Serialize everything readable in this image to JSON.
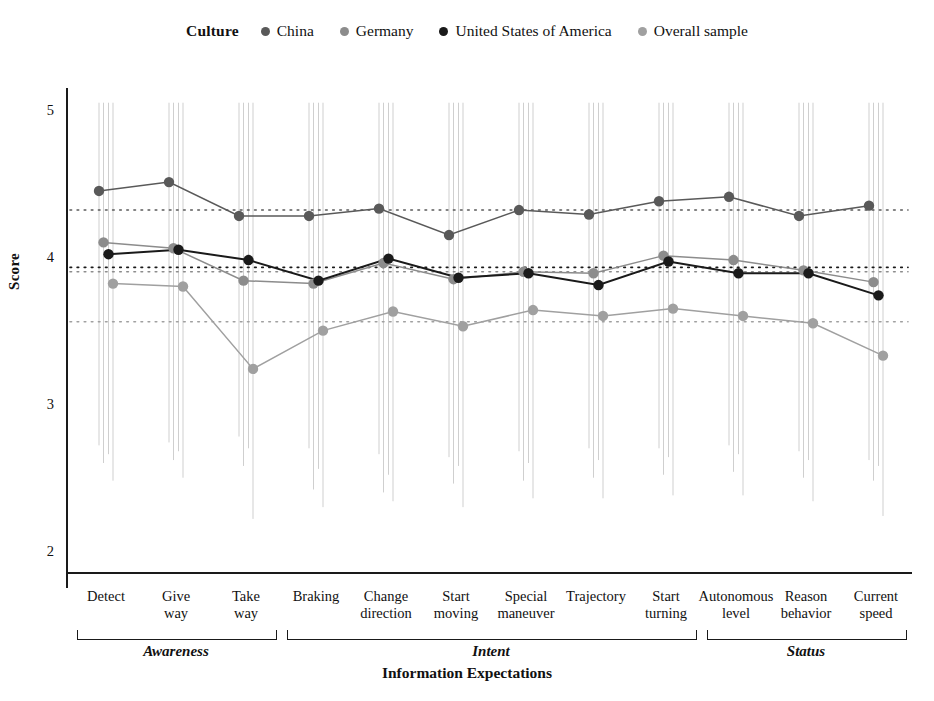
{
  "chart_data": {
    "type": "line",
    "title": "",
    "xlabel": "Information Expectations",
    "ylabel": "Score",
    "ylim": [
      1.75,
      5.15
    ],
    "yticks": [
      5,
      4,
      3,
      2
    ],
    "grid": false,
    "legend_title": "Culture",
    "legend_position": "top",
    "categories": [
      "Detect",
      "Give way",
      "Take way",
      "Braking",
      "Change direction",
      "Start moving",
      "Special maneuver",
      "Trajectory",
      "Start turning",
      "Autonomous level",
      "Reason behavior",
      "Current speed"
    ],
    "category_lines": [
      [
        "Detect"
      ],
      [
        "Give",
        "way"
      ],
      [
        "Take",
        "way"
      ],
      [
        "Braking"
      ],
      [
        "Change",
        "direction"
      ],
      [
        "Start",
        "moving"
      ],
      [
        "Special",
        "maneuver"
      ],
      [
        "Trajectory"
      ],
      [
        "Start",
        "turning"
      ],
      [
        "Autonomous",
        "level"
      ],
      [
        "Reason",
        "behavior"
      ],
      [
        "Current",
        "speed"
      ]
    ],
    "groups": [
      {
        "label": "Awareness",
        "start": 0,
        "end": 2
      },
      {
        "label": "Intent",
        "start": 3,
        "end": 8
      },
      {
        "label": "Status",
        "start": 9,
        "end": 11
      }
    ],
    "series": [
      {
        "name": "China",
        "color": "#595959",
        "values": [
          4.45,
          4.51,
          4.28,
          4.28,
          4.33,
          4.15,
          4.32,
          4.29,
          4.38,
          4.41,
          4.28,
          4.35
        ],
        "mean_line": 4.32,
        "err_low": [
          2.72,
          2.74,
          2.78,
          2.7,
          2.66,
          2.64,
          2.68,
          2.7,
          2.7,
          2.72,
          2.68,
          2.62
        ],
        "err_high": [
          5.05,
          5.05,
          5.05,
          5.05,
          5.05,
          5.05,
          5.05,
          5.05,
          5.05,
          5.05,
          5.05,
          5.05
        ]
      },
      {
        "name": "Germany",
        "color": "#8c8c8c",
        "values": [
          4.1,
          4.06,
          3.84,
          3.82,
          3.96,
          3.85,
          3.9,
          3.89,
          4.01,
          3.98,
          3.91,
          3.83
        ],
        "mean_line": 3.9,
        "err_low": [
          2.6,
          2.62,
          2.58,
          2.42,
          2.4,
          2.46,
          2.48,
          2.5,
          2.52,
          2.54,
          2.5,
          2.48
        ],
        "err_high": [
          5.05,
          5.05,
          5.05,
          5.05,
          5.05,
          5.05,
          5.05,
          5.05,
          5.05,
          5.05,
          5.05,
          5.05
        ]
      },
      {
        "name": "United States of America",
        "color": "#1a1a1a",
        "values": [
          4.02,
          4.05,
          3.98,
          3.84,
          3.99,
          3.86,
          3.89,
          3.81,
          3.97,
          3.89,
          3.89,
          3.74
        ],
        "mean_line": 3.93,
        "err_low": [
          2.66,
          2.68,
          2.7,
          2.56,
          2.52,
          2.58,
          2.6,
          2.62,
          2.64,
          2.66,
          2.62,
          2.58
        ],
        "err_high": [
          5.05,
          5.05,
          5.05,
          5.05,
          5.05,
          5.05,
          5.05,
          5.05,
          5.05,
          5.05,
          5.05,
          5.05
        ]
      },
      {
        "name": "Overall sample",
        "color": "#a0a0a0",
        "values": [
          3.82,
          3.8,
          3.24,
          3.5,
          3.63,
          3.53,
          3.64,
          3.6,
          3.65,
          3.6,
          3.55,
          3.33
        ],
        "mean_line": 3.56,
        "err_low": [
          2.48,
          2.5,
          2.22,
          2.3,
          2.34,
          2.3,
          2.36,
          2.36,
          2.38,
          2.38,
          2.34,
          2.24
        ],
        "err_high": [
          5.05,
          5.05,
          5.05,
          5.05,
          5.05,
          5.05,
          5.05,
          5.05,
          5.05,
          5.05,
          5.05,
          5.05
        ]
      }
    ]
  },
  "legend": {
    "title": "Culture",
    "items": [
      {
        "label": "China",
        "color": "#595959"
      },
      {
        "label": "Germany",
        "color": "#8c8c8c"
      },
      {
        "label": "United States of America",
        "color": "#1a1a1a"
      },
      {
        "label": "Overall sample",
        "color": "#a0a0a0"
      }
    ]
  },
  "axes": {
    "y_title": "Score",
    "x_title": "Information Expectations",
    "y_ticks": [
      "5",
      "4",
      "3",
      "2"
    ]
  }
}
